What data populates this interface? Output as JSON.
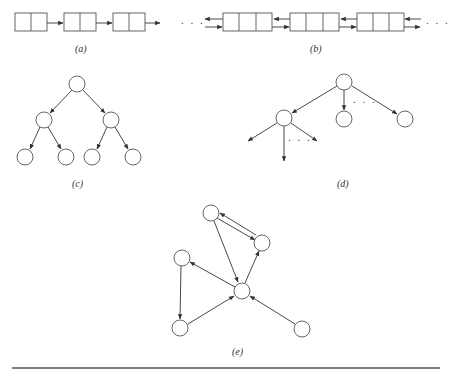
{
  "figure": {
    "panels": [
      {
        "id": "a",
        "label": "(a)",
        "title": "singly linked list",
        "nodes": 3,
        "cells_per_node": 2
      },
      {
        "id": "b",
        "label": "(b)",
        "title": "doubly linked list",
        "nodes": 3,
        "cells_per_node": 3,
        "ellipsis_left": ". . .",
        "ellipsis_right": ". . ."
      },
      {
        "id": "c",
        "label": "(c)",
        "title": "binary tree",
        "levels": 3,
        "nodes": 7
      },
      {
        "id": "d",
        "label": "(d)",
        "title": "general tree",
        "ellipsis_root": ". . .",
        "ellipsis_child": ". . ."
      },
      {
        "id": "e",
        "label": "(e)",
        "title": "directed graph",
        "nodes": 6
      }
    ],
    "colors": {
      "stroke": "#333333",
      "background": "#ffffff"
    }
  }
}
